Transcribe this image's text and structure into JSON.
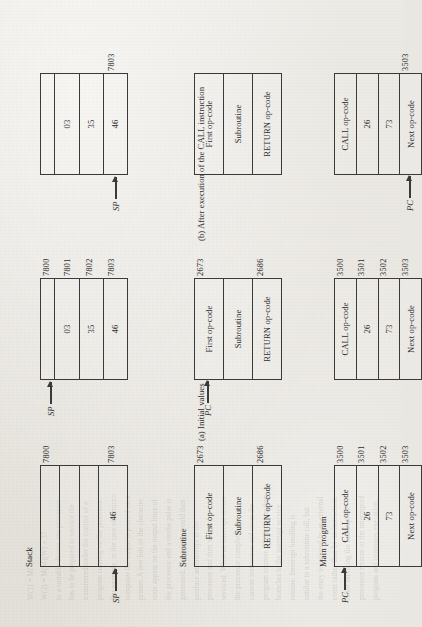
{
  "figure": {
    "stack": {
      "title": "Stack",
      "diagrams": [
        {
          "id": "stack-initial",
          "addresses": [
            "7800",
            "",
            "",
            "7803"
          ],
          "values": [
            "",
            "",
            "",
            "46"
          ],
          "pointer": {
            "label": "SP",
            "target_index": 3
          }
        },
        {
          "id": "stack-after-call",
          "addresses": [
            "7800",
            "7801",
            "7802",
            "7803"
          ],
          "values": [
            "",
            "03",
            "35",
            "46"
          ],
          "pointer": {
            "label": "SP",
            "target_index": 0
          }
        },
        {
          "id": "stack-after-return",
          "addresses": [
            "",
            "",
            "",
            "7803"
          ],
          "values": [
            "",
            "03",
            "35",
            "46"
          ],
          "pointer": {
            "label": "SP",
            "target_index": 3
          }
        }
      ]
    },
    "subroutine": {
      "title": "Subroutine",
      "diagrams": [
        {
          "id": "subroutine-initial",
          "addresses": [
            "2673",
            "",
            "2686"
          ],
          "values": [
            "First op-code",
            "Subroutine",
            "RETURN op-code"
          ],
          "pointer": null
        },
        {
          "id": "subroutine-after-call",
          "addresses": [
            "2673",
            "",
            "2686"
          ],
          "values": [
            "First op-code",
            "Subroutine",
            "RETURN op-code"
          ],
          "pointer": {
            "label": "PC",
            "target_index": 0
          }
        },
        {
          "id": "subroutine-after-return",
          "addresses": [
            "",
            "",
            ""
          ],
          "values": [
            "First op-code",
            "Subroutine",
            "RETURN op-code"
          ],
          "pointer": null
        }
      ]
    },
    "main_program": {
      "title": "Main program",
      "diagrams": [
        {
          "id": "main-initial",
          "addresses": [
            "3500",
            "3501",
            "3502",
            "3503"
          ],
          "values": [
            "CALL op-code",
            "26",
            "73",
            "Next op-code"
          ],
          "pointer": {
            "label": "PC",
            "target_index": 0
          }
        },
        {
          "id": "main-after-call",
          "addresses": [
            "3500",
            "3501",
            "3502",
            "3503"
          ],
          "values": [
            "CALL op-code",
            "26",
            "73",
            "Next op-code"
          ],
          "pointer": null
        },
        {
          "id": "main-after-return",
          "addresses": [
            "",
            "",
            "",
            "3503"
          ],
          "values": [
            "CALL op-code",
            "26",
            "73",
            "Next op-code"
          ],
          "pointer": {
            "label": "PC",
            "target_index": 3
          }
        }
      ]
    },
    "captions": [
      {
        "id": "caption-a",
        "text": "(a) Initial values"
      },
      {
        "id": "caption-b",
        "text": "(b) After execution of the CALL instruction"
      }
    ]
  },
  "background_text": {
    "lines": [
      "W(1) = M(1) + 27",
      "W(2) = M(M)(W) + 37",
      "to a suitable device, the processor",
      "has to be prepared to service the",
      "transferred under the control of a",
      "program running on the processor.",
      "For example, in the case of a micro-",
      "computer the output is printed on a",
      "printer. A few bits of the character",
      "code appear on the output lines of",
      "the processor and a strobe pulse is",
      "generated. The printer would then",
      "produce an interrupt to the",
      "processor and then wait to be",
      "serviced. When an interrupt occurs",
      "the processor completes the",
      "current instruction and saves the",
      "program counter. The program then",
      "branches to the interrupt service",
      "routine. Interrupt handling is",
      "similar to a subroutine call, but",
      "the entry is initiated by an external",
      "event rather than by an instruction.",
      "After servicing the interrupt the",
      "processor returns to the interrupted",
      "program and continues execution."
    ]
  },
  "colors": {
    "paper": "#e9e7e2",
    "ink": "#3a3a3a",
    "ghost": "#9a968d"
  }
}
